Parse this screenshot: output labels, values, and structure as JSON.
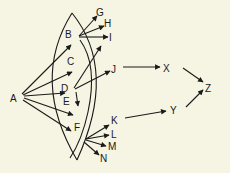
{
  "diagram": {
    "background": "#f6f4e2",
    "ink": "#1a1a1a",
    "nodes": {
      "A": "A",
      "B": "B",
      "C": "C",
      "D": "D",
      "E": "E",
      "F": "F",
      "G": "G",
      "H": "H",
      "I": "I",
      "J": "J",
      "K": "K",
      "L": "L",
      "M": "M",
      "N": "N",
      "X": "X",
      "Y": "Y",
      "Z": "Z"
    },
    "edges": [
      [
        "A",
        "B"
      ],
      [
        "A",
        "C"
      ],
      [
        "A",
        "D"
      ],
      [
        "A",
        "E"
      ],
      [
        "A",
        "F"
      ],
      [
        "B",
        "G"
      ],
      [
        "B",
        "H"
      ],
      [
        "B",
        "I"
      ],
      [
        "D",
        "I"
      ],
      [
        "D",
        "J"
      ],
      [
        "D",
        "E"
      ],
      [
        "F",
        "K"
      ],
      [
        "F",
        "L"
      ],
      [
        "F",
        "M"
      ],
      [
        "F",
        "N"
      ],
      [
        "J",
        "X"
      ],
      [
        "K",
        "Y"
      ],
      [
        "X",
        "Z"
      ],
      [
        "Y",
        "Z"
      ]
    ],
    "regions": [
      "outer-lens",
      "inner-curve"
    ]
  }
}
